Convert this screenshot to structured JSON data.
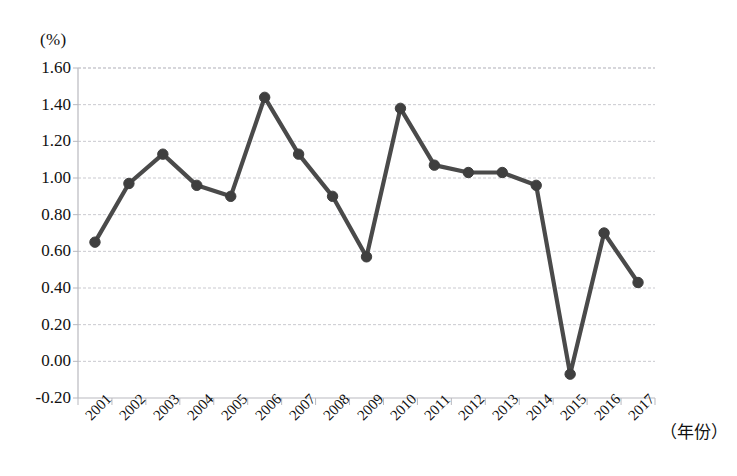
{
  "chart_data": {
    "type": "line",
    "title": "",
    "subtitle": "",
    "xlabel": "（年份）",
    "ylabel": "(%)",
    "unit_label": "(%)",
    "categories": [
      "2001",
      "2002",
      "2003",
      "2004",
      "2005",
      "2006",
      "2007",
      "2008",
      "2009",
      "2010",
      "2011",
      "2012",
      "2013",
      "2014",
      "2015",
      "2016",
      "2017"
    ],
    "values": [
      0.65,
      0.97,
      1.13,
      0.96,
      0.9,
      1.44,
      1.13,
      0.9,
      0.57,
      1.38,
      1.07,
      1.03,
      1.03,
      0.96,
      -0.07,
      0.7,
      0.43
    ],
    "series": [
      {
        "name": "",
        "values": [
          0.65,
          0.97,
          1.13,
          0.96,
          0.9,
          1.44,
          1.13,
          0.9,
          0.57,
          1.38,
          1.07,
          1.03,
          1.03,
          0.96,
          -0.07,
          0.7,
          0.43
        ]
      }
    ],
    "ylim": [
      -0.2,
      1.6
    ],
    "ytick_step": 0.2,
    "yticks": [
      "1.60",
      "1.40",
      "1.20",
      "1.00",
      "0.80",
      "0.60",
      "0.40",
      "0.20",
      "0.00",
      "-0.20"
    ],
    "ytick_values": [
      1.6,
      1.4,
      1.2,
      1.0,
      0.8,
      0.6,
      0.4,
      0.2,
      0.0,
      -0.2
    ],
    "xticks": [
      "2001",
      "2002",
      "2003",
      "2004",
      "2005",
      "2006",
      "2007",
      "2008",
      "2009",
      "2010",
      "2011",
      "2012",
      "2013",
      "2014",
      "2015",
      "2016",
      "2017"
    ],
    "grid": true,
    "grid_style": "dashed-horizontal",
    "legend": false,
    "legend_position": "none",
    "marker": "circle",
    "colors": {
      "line": "#4a4a4a",
      "marker": "#3f3f3f",
      "grid": "#c9c9cf",
      "axis": "#b9b9bf",
      "background": "#ffffff",
      "text": "#111111"
    }
  },
  "figure": {
    "unit_label": "(%)",
    "xaxis_title": "（年份）"
  }
}
